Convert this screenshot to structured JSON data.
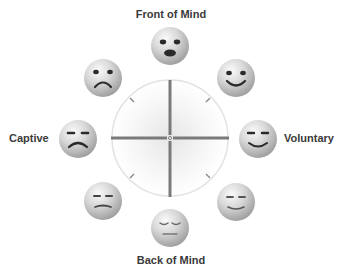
{
  "diagram": {
    "axes": {
      "top": "Front of Mind",
      "bottom": "Back of Mind",
      "left": "Captive",
      "right": "Voluntary"
    },
    "faces": [
      {
        "position": "top",
        "expression": "surprised"
      },
      {
        "position": "top-right",
        "expression": "smiling"
      },
      {
        "position": "right",
        "expression": "content-smile"
      },
      {
        "position": "bottom-right",
        "expression": "relaxed-smile"
      },
      {
        "position": "bottom",
        "expression": "sleepy-neutral"
      },
      {
        "position": "bottom-left",
        "expression": "bored-frown"
      },
      {
        "position": "left",
        "expression": "sad-frown"
      },
      {
        "position": "top-left",
        "expression": "sad"
      }
    ],
    "colors": {
      "face_fill": "#cfcfcf",
      "face_highlight": "#f4f4f4",
      "feature": "#2a2a2a",
      "axis": "#7a7a7a",
      "circle": "#e2e2e2",
      "label": "#3a3a3a"
    }
  }
}
